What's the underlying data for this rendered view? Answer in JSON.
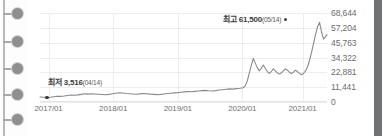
{
  "sidebar": {
    "name": "timeline-rail",
    "nodes": [
      {
        "label": "node-1"
      },
      {
        "label": "node-2"
      },
      {
        "label": "node-3"
      },
      {
        "label": "node-4"
      },
      {
        "label": "node-5"
      }
    ]
  },
  "scrollbar": {
    "label": "vertical-scrollbar"
  },
  "chart_data": {
    "type": "line",
    "title": "",
    "xlabel": "",
    "ylabel": "",
    "grid": true,
    "legend": "none",
    "ylim": [
      0,
      68644
    ],
    "ytick_labels": [
      "68,644",
      "57,204",
      "45,763",
      "34,322",
      "22,881",
      "11,441",
      "0"
    ],
    "ytick_values": [
      68644,
      57204,
      45763,
      34322,
      22881,
      11441,
      0
    ],
    "xtick_labels": [
      "2017/01",
      "2018/01",
      "2019/01",
      "2020/01",
      "2021/01"
    ],
    "xtick_positions": [
      0.03,
      0.255,
      0.48,
      0.705,
      0.915
    ],
    "annotations": [
      {
        "name": "max-annotation",
        "prefix": "최고",
        "value": "61,500",
        "date": "(05/14)",
        "y_value": 61500
      },
      {
        "name": "min-annotation",
        "prefix": "최저",
        "value": "3,516",
        "date": "(04/14)",
        "y_value": 3516
      }
    ],
    "series": [
      {
        "name": "price",
        "color": "#8a8a8a",
        "x": [
          0.0,
          0.012,
          0.024,
          0.036,
          0.048,
          0.06,
          0.072,
          0.084,
          0.096,
          0.108,
          0.12,
          0.132,
          0.144,
          0.156,
          0.168,
          0.18,
          0.192,
          0.204,
          0.216,
          0.228,
          0.24,
          0.252,
          0.264,
          0.276,
          0.288,
          0.3,
          0.312,
          0.324,
          0.336,
          0.348,
          0.36,
          0.372,
          0.384,
          0.396,
          0.408,
          0.42,
          0.432,
          0.444,
          0.456,
          0.468,
          0.48,
          0.492,
          0.504,
          0.516,
          0.528,
          0.54,
          0.552,
          0.564,
          0.576,
          0.588,
          0.6,
          0.612,
          0.624,
          0.636,
          0.648,
          0.66,
          0.672,
          0.684,
          0.696,
          0.708,
          0.715,
          0.722,
          0.729,
          0.736,
          0.743,
          0.75,
          0.757,
          0.764,
          0.771,
          0.778,
          0.785,
          0.792,
          0.799,
          0.806,
          0.813,
          0.82,
          0.827,
          0.834,
          0.841,
          0.848,
          0.855,
          0.862,
          0.869,
          0.876,
          0.883,
          0.89,
          0.897,
          0.904,
          0.911,
          0.918,
          0.925,
          0.932,
          0.939,
          0.946,
          0.953,
          0.96,
          0.967,
          0.974,
          0.981,
          0.988,
          1.0
        ],
        "values": [
          3900,
          3700,
          3516,
          3700,
          4100,
          4400,
          4300,
          4600,
          5000,
          5400,
          5200,
          5500,
          5900,
          6300,
          6100,
          6400,
          6200,
          6000,
          5800,
          5600,
          5900,
          6300,
          6800,
          7100,
          6900,
          6600,
          6400,
          6200,
          6000,
          6300,
          6600,
          6400,
          6100,
          5900,
          5700,
          5900,
          6200,
          6500,
          6800,
          7000,
          7200,
          7500,
          7800,
          8100,
          7900,
          8200,
          8500,
          8800,
          9000,
          8700,
          8500,
          8800,
          9200,
          9500,
          9800,
          10100,
          9900,
          10300,
          10600,
          11000,
          12500,
          16000,
          22000,
          28000,
          33500,
          30000,
          26500,
          24000,
          26000,
          28500,
          26000,
          23500,
          22000,
          23500,
          25500,
          24000,
          22500,
          21500,
          22500,
          24000,
          25500,
          24500,
          23000,
          22000,
          23000,
          24500,
          23500,
          22000,
          21000,
          22000,
          24000,
          27000,
          32000,
          38000,
          45000,
          52000,
          58000,
          61500,
          54000,
          48500,
          52000
        ],
        "style": "solid",
        "width": 1.1
      }
    ]
  }
}
